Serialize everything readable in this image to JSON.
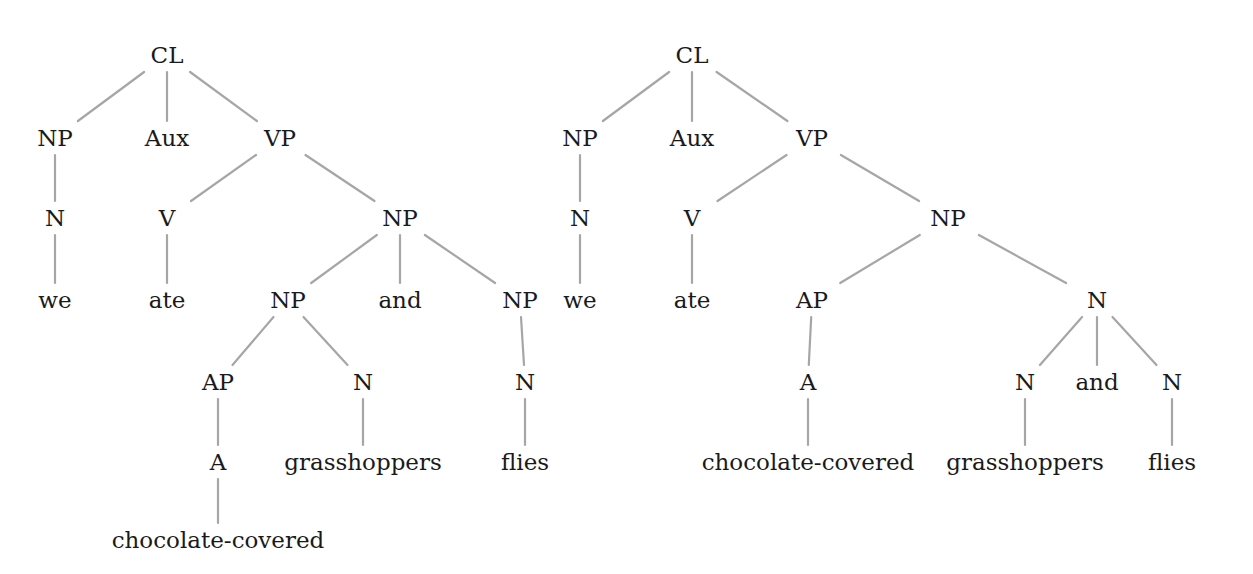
{
  "diagram": {
    "type": "syntax-tree-comparison",
    "colors": {
      "edge": "#a6a6a6",
      "text": "#1a1a1a",
      "background": "#ffffff"
    },
    "trees": [
      {
        "id": "left",
        "nodes": [
          {
            "id": "L0",
            "label": "CL",
            "x": 167,
            "y": 55
          },
          {
            "id": "L1",
            "label": "NP",
            "x": 55,
            "y": 138
          },
          {
            "id": "L2",
            "label": "Aux",
            "x": 167,
            "y": 138
          },
          {
            "id": "L3",
            "label": "VP",
            "x": 280,
            "y": 138
          },
          {
            "id": "L4",
            "label": "N",
            "x": 55,
            "y": 218
          },
          {
            "id": "L5",
            "label": "V",
            "x": 167,
            "y": 218
          },
          {
            "id": "L6",
            "label": "NP",
            "x": 400,
            "y": 218
          },
          {
            "id": "L7",
            "label": "we",
            "x": 55,
            "y": 300
          },
          {
            "id": "L8",
            "label": "ate",
            "x": 167,
            "y": 300
          },
          {
            "id": "L9",
            "label": "NP",
            "x": 288,
            "y": 300
          },
          {
            "id": "L10",
            "label": "and",
            "x": 400,
            "y": 300
          },
          {
            "id": "L11",
            "label": "NP",
            "x": 520,
            "y": 300
          },
          {
            "id": "L12",
            "label": "AP",
            "x": 218,
            "y": 382
          },
          {
            "id": "L13",
            "label": "N",
            "x": 363,
            "y": 382
          },
          {
            "id": "L14",
            "label": "N",
            "x": 525,
            "y": 382
          },
          {
            "id": "L15",
            "label": "A",
            "x": 218,
            "y": 462
          },
          {
            "id": "L16",
            "label": "grasshoppers",
            "x": 363,
            "y": 462
          },
          {
            "id": "L17",
            "label": "flies",
            "x": 525,
            "y": 462
          },
          {
            "id": "L18",
            "label": "chocolate-covered",
            "x": 218,
            "y": 540
          }
        ],
        "edges": [
          [
            "L0",
            "L1"
          ],
          [
            "L0",
            "L2"
          ],
          [
            "L0",
            "L3"
          ],
          [
            "L1",
            "L4"
          ],
          [
            "L4",
            "L7"
          ],
          [
            "L3",
            "L5"
          ],
          [
            "L3",
            "L6"
          ],
          [
            "L5",
            "L8"
          ],
          [
            "L6",
            "L9"
          ],
          [
            "L6",
            "L10"
          ],
          [
            "L6",
            "L11"
          ],
          [
            "L9",
            "L12"
          ],
          [
            "L9",
            "L13"
          ],
          [
            "L11",
            "L14"
          ],
          [
            "L12",
            "L15"
          ],
          [
            "L13",
            "L16"
          ],
          [
            "L14",
            "L17"
          ],
          [
            "L15",
            "L18"
          ]
        ]
      },
      {
        "id": "right",
        "nodes": [
          {
            "id": "R0",
            "label": "CL",
            "x": 692,
            "y": 55
          },
          {
            "id": "R1",
            "label": "NP",
            "x": 580,
            "y": 138
          },
          {
            "id": "R2",
            "label": "Aux",
            "x": 692,
            "y": 138
          },
          {
            "id": "R3",
            "label": "VP",
            "x": 812,
            "y": 138
          },
          {
            "id": "R4",
            "label": "N",
            "x": 580,
            "y": 218
          },
          {
            "id": "R5",
            "label": "V",
            "x": 692,
            "y": 218
          },
          {
            "id": "R6",
            "label": "NP",
            "x": 948,
            "y": 218
          },
          {
            "id": "R7",
            "label": "we",
            "x": 580,
            "y": 300
          },
          {
            "id": "R8",
            "label": "ate",
            "x": 692,
            "y": 300
          },
          {
            "id": "R9",
            "label": "AP",
            "x": 812,
            "y": 300
          },
          {
            "id": "R10",
            "label": "N",
            "x": 1097,
            "y": 300
          },
          {
            "id": "R11",
            "label": "A",
            "x": 808,
            "y": 382
          },
          {
            "id": "R12",
            "label": "N",
            "x": 1025,
            "y": 382
          },
          {
            "id": "R13",
            "label": "and",
            "x": 1097,
            "y": 382
          },
          {
            "id": "R14",
            "label": "N",
            "x": 1172,
            "y": 382
          },
          {
            "id": "R15",
            "label": "chocolate-covered",
            "x": 808,
            "y": 462
          },
          {
            "id": "R16",
            "label": "grasshoppers",
            "x": 1025,
            "y": 462
          },
          {
            "id": "R17",
            "label": "flies",
            "x": 1172,
            "y": 462
          }
        ],
        "edges": [
          [
            "R0",
            "R1"
          ],
          [
            "R0",
            "R2"
          ],
          [
            "R0",
            "R3"
          ],
          [
            "R1",
            "R4"
          ],
          [
            "R4",
            "R7"
          ],
          [
            "R3",
            "R5"
          ],
          [
            "R3",
            "R6"
          ],
          [
            "R5",
            "R8"
          ],
          [
            "R6",
            "R9"
          ],
          [
            "R6",
            "R10"
          ],
          [
            "R9",
            "R11"
          ],
          [
            "R11",
            "R15"
          ],
          [
            "R10",
            "R12"
          ],
          [
            "R10",
            "R13"
          ],
          [
            "R10",
            "R14"
          ],
          [
            "R12",
            "R16"
          ],
          [
            "R14",
            "R17"
          ]
        ]
      }
    ]
  }
}
